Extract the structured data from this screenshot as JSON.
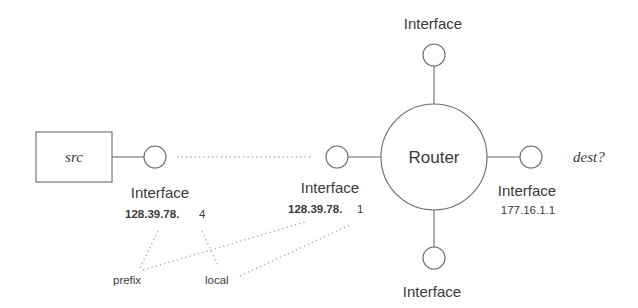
{
  "diagram": {
    "source": {
      "label": "src"
    },
    "destination": {
      "label": "dest?"
    },
    "router": {
      "label": "Router"
    },
    "interfaces": {
      "src_interface": {
        "label": "Interface",
        "address_prefix": "128.39.78.",
        "address_local": "4"
      },
      "router_left": {
        "label": "Interface",
        "address_prefix": "128.39.78.",
        "address_local": "1"
      },
      "router_right": {
        "label": "Interface",
        "address": "177.16.1.1"
      },
      "router_top": {
        "label": "Interface"
      },
      "router_bottom": {
        "label": "Interface"
      }
    },
    "annotations": {
      "prefix": "prefix",
      "local": "local"
    },
    "colors": {
      "stroke": "#6a6a6a",
      "dotted": "#b0b0b0",
      "text": "#3a3a3a"
    }
  }
}
